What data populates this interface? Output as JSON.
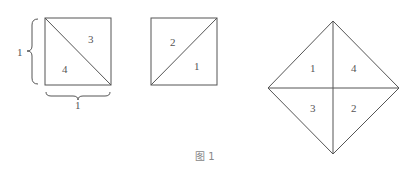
{
  "figure": {
    "caption": "图 1",
    "square_a": {
      "dimension_left": "1",
      "dimension_bottom": "1",
      "triangles": [
        "3",
        "4"
      ]
    },
    "square_b": {
      "triangles": [
        "2",
        "1"
      ]
    },
    "diamond": {
      "regions": [
        "1",
        "4",
        "3",
        "2"
      ]
    }
  }
}
